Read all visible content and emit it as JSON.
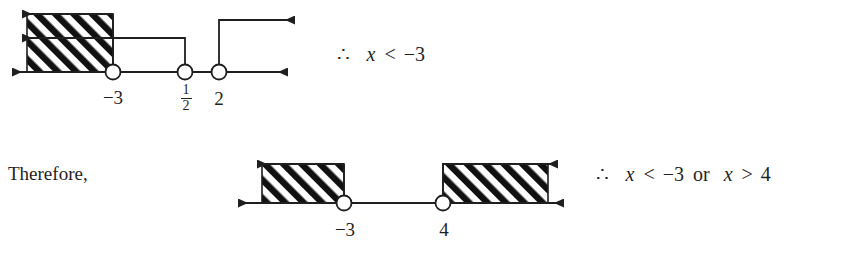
{
  "document": {
    "background_color": "#ffffff",
    "ink_color": "#1f1f1f"
  },
  "connective": {
    "therefore_word": "Therefore,"
  },
  "rows": [
    {
      "id": "row-1",
      "conclusion": {
        "therefore_symbol": "∴",
        "variable": "x",
        "relation": "<",
        "value": "−3",
        "full_text": "∴ x < −3"
      },
      "number_line": {
        "id": "number-line-1",
        "tick_labels": [
          {
            "id": "tick-neg3",
            "text": "−3",
            "kind": "integer"
          },
          {
            "id": "tick-one-half",
            "numerator": "1",
            "denominator": "2",
            "kind": "fraction"
          },
          {
            "id": "tick-2",
            "text": "2",
            "kind": "integer"
          }
        ],
        "points": [
          {
            "label": "−3",
            "marker": "open-circle"
          },
          {
            "label": "1/2",
            "marker": "open-circle"
          },
          {
            "label": "2",
            "marker": "open-circle"
          }
        ],
        "shaded_region": {
          "fill": "diagonal-hatch",
          "direction": "left",
          "from_label": "−3"
        },
        "rays": [
          {
            "id": "ray-top",
            "direction": "left",
            "origin_label": "−3"
          },
          {
            "id": "ray-middle",
            "direction": "left",
            "origin_label": "1/2"
          },
          {
            "id": "ray-right",
            "direction": "right",
            "origin_label": "2"
          },
          {
            "id": "axis-ray-left",
            "direction": "left"
          },
          {
            "id": "axis-ray-right",
            "direction": "right"
          }
        ]
      }
    },
    {
      "id": "row-2",
      "conclusion": {
        "therefore_symbol": "∴",
        "variable_left": "x",
        "relation_left": "<",
        "value_left": "−3",
        "connector": "or",
        "variable_right": "x",
        "relation_right": ">",
        "value_right": "4",
        "full_text": "∴ x < −3 or x > 4"
      },
      "number_line": {
        "id": "number-line-2",
        "tick_labels": [
          {
            "id": "tick-neg3b",
            "text": "−3",
            "kind": "integer"
          },
          {
            "id": "tick-4",
            "text": "4",
            "kind": "integer"
          }
        ],
        "points": [
          {
            "label": "−3",
            "marker": "open-circle"
          },
          {
            "label": "4",
            "marker": "open-circle"
          }
        ],
        "shaded_regions": [
          {
            "fill": "diagonal-hatch",
            "direction": "left",
            "from_label": "−3"
          },
          {
            "fill": "diagonal-hatch",
            "direction": "right",
            "from_label": "4"
          }
        ],
        "rays": [
          {
            "id": "ray-left-top",
            "direction": "left",
            "origin_label": "−3"
          },
          {
            "id": "ray-right-top",
            "direction": "right",
            "origin_label": "4"
          },
          {
            "id": "axis-ray-left",
            "direction": "left"
          },
          {
            "id": "axis-ray-right",
            "direction": "right"
          }
        ]
      }
    }
  ]
}
